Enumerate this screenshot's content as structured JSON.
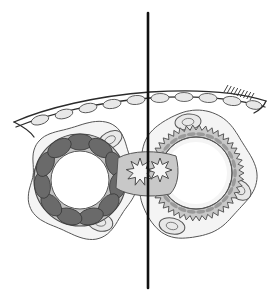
{
  "figure": {
    "background_color": "#ffffff",
    "width": 274,
    "height": 295,
    "caption": ""
  },
  "palette": {
    "outline": "#2b2b2b",
    "thin_outline": "#555555",
    "fill_light": "#f2f2f2",
    "fill_mid": "#c8c8c8",
    "fill_ring": "#b4b4b4",
    "fill_dark_segment": "#6a6a6a",
    "fill_lumen": "#ffffff",
    "fill_satellite": "#e8e8e8",
    "axis_line": "#111111"
  },
  "axis": {
    "name": "midline-axis",
    "orientation": "vertical",
    "x": 148,
    "y_start": 13,
    "y_end": 288,
    "stroke_width": 2.6,
    "color": "#111111",
    "label": ""
  },
  "membrane": {
    "name": "epithelial-membrane",
    "description": "curved double-line epithelial sheet with oval cells",
    "stroke": "#2b2b2b",
    "stroke_width": 1.3,
    "path_outer": "M 14 122 C 46 108, 96 96, 150 92 C 198 89, 238 92, 266 101",
    "path_inner": "M 16 127 C 48 114, 98 102, 150 98 C 198 95, 238 99, 265 107",
    "cells": [
      {
        "cx": 40,
        "cy": 120,
        "rx": 9,
        "ry": 4.5,
        "rot": -17
      },
      {
        "cx": 64,
        "cy": 114,
        "rx": 9,
        "ry": 4.5,
        "rot": -14
      },
      {
        "cx": 88,
        "cy": 108,
        "rx": 9,
        "ry": 4.5,
        "rot": -11
      },
      {
        "cx": 112,
        "cy": 104,
        "rx": 9,
        "ry": 4.5,
        "rot": -8
      },
      {
        "cx": 136,
        "cy": 100,
        "rx": 9,
        "ry": 4.5,
        "rot": -5
      },
      {
        "cx": 160,
        "cy": 98,
        "rx": 9,
        "ry": 4.5,
        "rot": -2
      },
      {
        "cx": 184,
        "cy": 97,
        "rx": 9,
        "ry": 4.5,
        "rot": 1
      },
      {
        "cx": 208,
        "cy": 98,
        "rx": 9,
        "ry": 4.5,
        "rot": 4
      },
      {
        "cx": 232,
        "cy": 101,
        "rx": 9,
        "ry": 4.5,
        "rot": 7
      },
      {
        "cx": 254,
        "cy": 105,
        "rx": 8,
        "ry": 4.2,
        "rot": 10
      }
    ],
    "hatch_marks": {
      "name": "membrane-hatching",
      "count": 9,
      "x_start": 224,
      "x_end": 250,
      "y_base": 92,
      "length": 7
    }
  },
  "left_structure": {
    "name": "left-cross-section",
    "label": "",
    "center": {
      "x": 80,
      "y": 180
    },
    "outer_capsule": {
      "description": "irregular lobed capsule outline",
      "stroke": "#555555",
      "fill": "#f4f4f4"
    },
    "lobes": [
      {
        "name": "lobe-top-right",
        "cx": 110,
        "cy": 140,
        "rx": 13,
        "ry": 8,
        "rot": -30
      },
      {
        "name": "lobe-left",
        "cx": 44,
        "cy": 174,
        "rx": 10,
        "ry": 13,
        "rot": 10
      },
      {
        "name": "lobe-bottom",
        "cx": 100,
        "cy": 222,
        "rx": 13,
        "ry": 9,
        "rot": 15
      }
    ],
    "ring": {
      "name": "muscular-ring",
      "outer_r": 46,
      "inner_r": 30,
      "fill": "#c2c2c2",
      "stroke": "#4a4a4a"
    },
    "lumen": {
      "name": "lumen",
      "r": 29,
      "fill": "#ffffff"
    },
    "segments": {
      "name": "dark-segment-ring",
      "count": 11,
      "fill": "#6a6a6a",
      "stroke": "#3a3a3a",
      "radius": 38,
      "arc_width": 13,
      "arc_height": 8
    },
    "edge_style": "smooth"
  },
  "right_structure": {
    "name": "right-cross-section",
    "label": "",
    "center": {
      "x": 196,
      "y": 173
    },
    "outer_capsule": {
      "description": "irregular lobed capsule outline",
      "stroke": "#555555",
      "fill": "#f4f4f4"
    },
    "lobes": [
      {
        "name": "lobe-top",
        "cx": 188,
        "cy": 122,
        "rx": 13,
        "ry": 8,
        "rot": -6
      },
      {
        "name": "lobe-right",
        "cx": 240,
        "cy": 190,
        "rx": 12,
        "ry": 9,
        "rot": 40
      },
      {
        "name": "lobe-bottom-left",
        "cx": 172,
        "cy": 226,
        "rx": 13,
        "ry": 8,
        "rot": 12
      }
    ],
    "ring": {
      "name": "serrated-ring",
      "outer_r": 48,
      "inner_r": 36,
      "fill": "#c8c8c8",
      "stroke": "#4a4a4a",
      "teeth": 46,
      "tooth_depth": 5
    },
    "lumen": {
      "name": "lumen",
      "r": 34,
      "fill": "#ffffff"
    },
    "inner_dashes": {
      "name": "inner-dash-ring",
      "count": 26,
      "radius": 39,
      "fill": "#9a9a9a"
    },
    "edge_style": "serrated"
  },
  "junction": {
    "name": "central-star-junction",
    "center": {
      "x": 140,
      "y": 172
    },
    "points": 9,
    "outer_r": 14,
    "inner_r": 7,
    "fill": "#f6f6f6",
    "stroke": "#4a4a4a",
    "second_star": {
      "center": {
        "x": 160,
        "y": 170
      },
      "points": 8,
      "outer_r": 12,
      "inner_r": 6
    }
  },
  "legend": {
    "visible": false,
    "items": []
  }
}
